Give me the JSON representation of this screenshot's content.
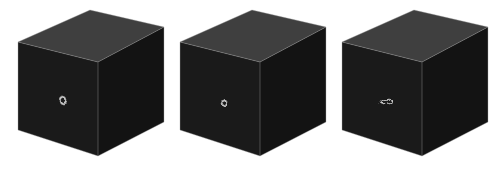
{
  "scene": {
    "title": "Procedural marble/wood-grain texture on three cubes",
    "background_color": "#ffffff",
    "width": 498,
    "height": 179,
    "object_count": 3,
    "projection": "perspective-3d",
    "palette": {
      "band_dark": "#1f1f1f",
      "band_light": "#e8e8e8",
      "top_face_tint": "#f2f2f2",
      "front_face_tint": "#d8d8d8",
      "side_face_tint": "#b4b4b4",
      "outline": "#9a9a9a"
    }
  },
  "cubes": [
    {
      "id": "cube-1",
      "label": "Cube 1",
      "turbulence_level": "low",
      "turbulence_value": 0.15,
      "ring_frequency": 26,
      "pattern": "concentric-rings",
      "ring_center_front": [
        62,
        100
      ],
      "geometry": {
        "top": [
          [
            18,
            42
          ],
          [
            90,
            10
          ],
          [
            164,
            27
          ],
          [
            98,
            62
          ]
        ],
        "front": [
          [
            18,
            42
          ],
          [
            98,
            62
          ],
          [
            98,
            156
          ],
          [
            18,
            130
          ]
        ],
        "side": [
          [
            98,
            62
          ],
          [
            164,
            27
          ],
          [
            164,
            122
          ],
          [
            98,
            156
          ]
        ]
      }
    },
    {
      "id": "cube-2",
      "label": "Cube 2",
      "turbulence_level": "medium",
      "turbulence_value": 0.45,
      "ring_frequency": 26,
      "pattern": "warped-concentric-rings",
      "ring_center_front": [
        224,
        100
      ],
      "geometry": {
        "top": [
          [
            180,
            42
          ],
          [
            252,
            10
          ],
          [
            326,
            27
          ],
          [
            260,
            62
          ]
        ],
        "front": [
          [
            180,
            42
          ],
          [
            260,
            62
          ],
          [
            260,
            156
          ],
          [
            180,
            130
          ]
        ],
        "side": [
          [
            260,
            62
          ],
          [
            326,
            27
          ],
          [
            326,
            122
          ],
          [
            260,
            156
          ]
        ]
      }
    },
    {
      "id": "cube-3",
      "label": "Cube 3",
      "turbulence_level": "high",
      "turbulence_value": 0.95,
      "ring_frequency": 26,
      "pattern": "turbulent-marble",
      "ring_center_front": [
        386,
        100
      ],
      "geometry": {
        "top": [
          [
            342,
            42
          ],
          [
            414,
            10
          ],
          [
            488,
            27
          ],
          [
            422,
            62
          ]
        ],
        "front": [
          [
            342,
            42
          ],
          [
            422,
            62
          ],
          [
            422,
            156
          ],
          [
            342,
            130
          ]
        ],
        "side": [
          [
            422,
            62
          ],
          [
            488,
            27
          ],
          [
            488,
            122
          ],
          [
            422,
            156
          ]
        ]
      }
    }
  ]
}
